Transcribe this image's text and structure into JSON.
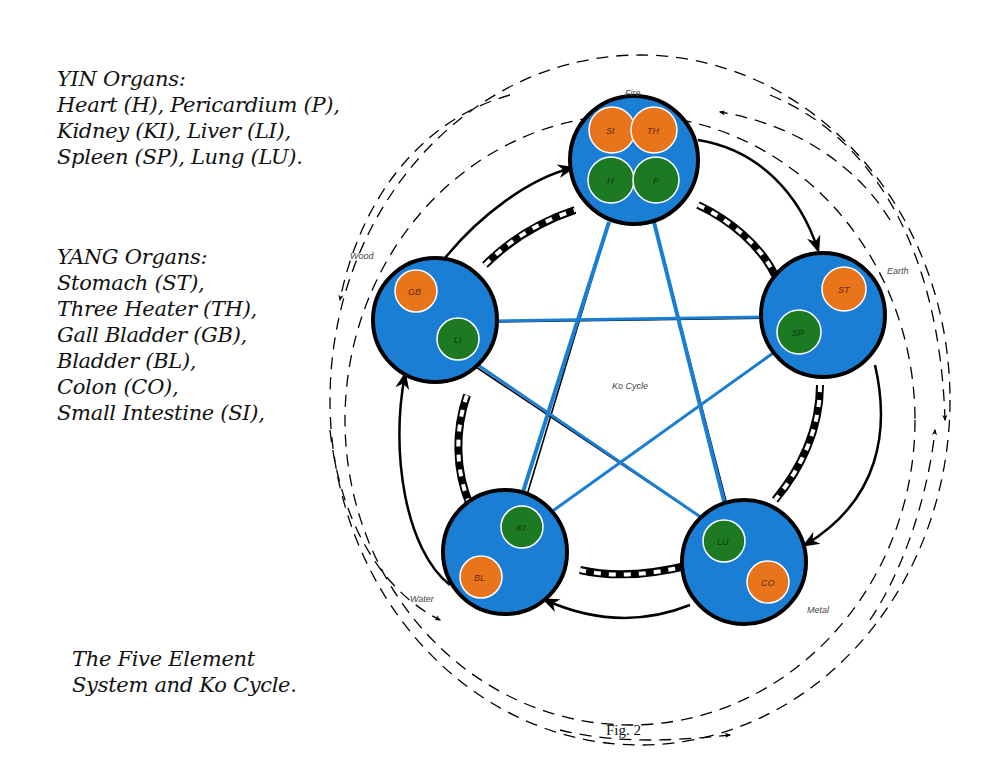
{
  "yin": {
    "title": "YIN Organs:",
    "lines": [
      "Heart (H), Pericardium (P),",
      "Kidney (KI), Liver (LI),",
      "Spleen (SP), Lung (LU)."
    ]
  },
  "yang": {
    "title": "YANG Organs:",
    "lines": [
      "Stomach (ST),",
      "Three Heater (TH),",
      "Gall Bladder (GB),",
      "Bladder (BL),",
      "Colon (CO),",
      "Small Intestine (SI),"
    ]
  },
  "caption": [
    "The Five Element",
    "System and Ko Cycle."
  ],
  "figure_label": "Fig. 2",
  "center_label": "Ko Cycle",
  "colors": {
    "element_fill": "#1a7fd4",
    "yang_organ": "#e8741c",
    "yin_organ": "#1d7a22",
    "stroke": "#000000"
  },
  "elements": [
    {
      "name": "Fire",
      "organs": [
        {
          "code": "SI",
          "type": "yang"
        },
        {
          "code": "TH",
          "type": "yang"
        },
        {
          "code": "H",
          "type": "yin"
        },
        {
          "code": "P",
          "type": "yin"
        }
      ]
    },
    {
      "name": "Earth",
      "organs": [
        {
          "code": "ST",
          "type": "yang"
        },
        {
          "code": "SP",
          "type": "yin"
        }
      ]
    },
    {
      "name": "Metal",
      "organs": [
        {
          "code": "LU",
          "type": "yin"
        },
        {
          "code": "CO",
          "type": "yang"
        }
      ]
    },
    {
      "name": "Water",
      "organs": [
        {
          "code": "KI",
          "type": "yin"
        },
        {
          "code": "BL",
          "type": "yang"
        }
      ]
    },
    {
      "name": "Wood",
      "organs": [
        {
          "code": "GB",
          "type": "yang"
        },
        {
          "code": "LI",
          "type": "yin"
        }
      ]
    }
  ]
}
